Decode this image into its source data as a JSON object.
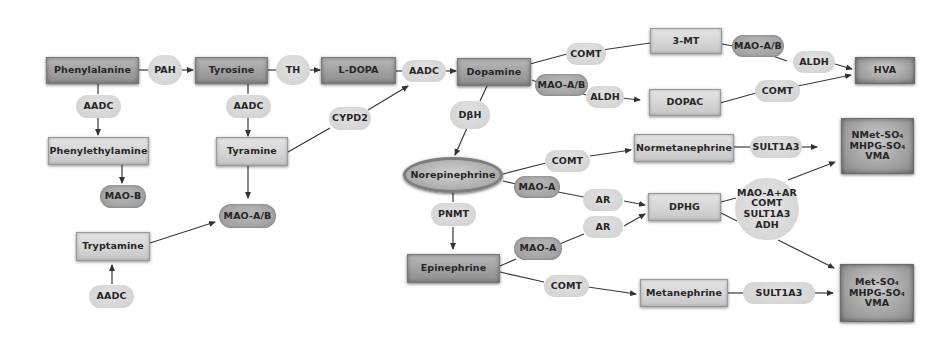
{
  "diagram": {
    "type": "metabolic-pathway",
    "colors": {
      "background": "#ffffff",
      "substrate_dark": "#a4a4a4",
      "substrate_light": "#d6d6d6",
      "enzyme_light": "#d8d8d8",
      "enzyme_dark": "#a8a8a8",
      "edge": "#333333"
    },
    "nodes": {
      "phenylalanine": "Phenylalanine",
      "pah": "PAH",
      "tyrosine": "Tyrosine",
      "th": "TH",
      "ldopa": "L-DOPA",
      "aadc_ldopa": "AADC",
      "dopamine": "Dopamine",
      "aadc_phe": "AADC",
      "phenylethylamine": "Phenylethylamine",
      "maob": "MAO-B",
      "aadc_tyr": "AADC",
      "tyramine": "Tyramine",
      "cypd2": "CYPD2",
      "maoab_tyr": "MAO-A/B",
      "tryptamine": "Tryptamine",
      "aadc_trp": "AADC",
      "comt_da": "COMT",
      "three_mt": "3-MT",
      "maoab_3mt": "MAO-A/B",
      "aldh_3mt": "ALDH",
      "hva": "HVA",
      "maoab_da": "MAO-A/B",
      "aldh_da": "ALDH",
      "dopac": "DOPAC",
      "comt_dopac": "COMT",
      "dbh": "DβH",
      "norepinephrine": "Norepinephrine",
      "comt_ne": "COMT",
      "normetanephrine": "Normetanephrine",
      "sult_nmn": "SULT1A3",
      "end_ne": [
        "NMet-SO₄",
        "MHPG-SO₄",
        "VMA"
      ],
      "maoa_ne": "MAO-A",
      "ar_ne": "AR",
      "dphg": "DPHG",
      "multi_enzyme": [
        "MAO-A+AR",
        "COMT",
        "SULT1A3",
        "ADH"
      ],
      "pnmt": "PNMT",
      "epinephrine": "Epinephrine",
      "maoa_epi": "MAO-A",
      "ar_epi": "AR",
      "comt_epi": "COMT",
      "metanephrine": "Metanephrine",
      "sult_mn": "SULT1A3",
      "end_epi": [
        "Met-SO₄",
        "MHPG-SO₄",
        "VMA"
      ]
    },
    "edges": [
      [
        "Phenylalanine",
        "PAH",
        "Tyrosine"
      ],
      [
        "Tyrosine",
        "TH",
        "L-DOPA"
      ],
      [
        "L-DOPA",
        "AADC",
        "Dopamine"
      ],
      [
        "Phenylalanine",
        "AADC",
        "Phenylethylamine"
      ],
      [
        "Phenylethylamine",
        "",
        "MAO-B"
      ],
      [
        "Tyrosine",
        "AADC",
        "Tyramine"
      ],
      [
        "Tyramine",
        "",
        "MAO-A/B"
      ],
      [
        "Tyramine",
        "CYPD2",
        "Dopamine"
      ],
      [
        "Tryptamine",
        "",
        "MAO-A/B"
      ],
      [
        "AADC",
        "",
        "Tryptamine"
      ],
      [
        "Dopamine",
        "COMT",
        "3-MT"
      ],
      [
        "3-MT",
        "MAO-A/B, ALDH",
        "HVA"
      ],
      [
        "Dopamine",
        "MAO-A/B, ALDH",
        "DOPAC"
      ],
      [
        "DOPAC",
        "COMT",
        "HVA"
      ],
      [
        "Dopamine",
        "DβH",
        "Norepinephrine"
      ],
      [
        "Norepinephrine",
        "COMT",
        "Normetanephrine"
      ],
      [
        "Normetanephrine",
        "SULT1A3",
        "NMet-SO₄ / MHPG-SO₄ / VMA"
      ],
      [
        "Norepinephrine",
        "MAO-A, AR",
        "DPHG"
      ],
      [
        "Norepinephrine",
        "PNMT",
        "Epinephrine"
      ],
      [
        "Epinephrine",
        "MAO-A, AR",
        "DPHG"
      ],
      [
        "Epinephrine",
        "COMT",
        "Metanephrine"
      ],
      [
        "Metanephrine",
        "SULT1A3",
        "Met-SO₄ / MHPG-SO₄ / VMA"
      ],
      [
        "DPHG",
        "MAO-A+AR, COMT, SULT1A3, ADH",
        "NMet-SO₄ / MHPG-SO₄ / VMA"
      ],
      [
        "DPHG",
        "MAO-A+AR, COMT, SULT1A3, ADH",
        "Met-SO₄ / MHPG-SO₄ / VMA"
      ]
    ]
  }
}
